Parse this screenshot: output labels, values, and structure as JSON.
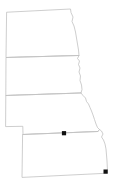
{
  "figure": {
    "title": "Great Plains states outline map",
    "width": 119,
    "height": 192,
    "background_color": "#ffffff",
    "border_color": "#b9b9b9",
    "internal_border_color": "#c2c2c2",
    "marker_color": "#111111"
  },
  "regions": [
    {
      "id": "north-dakota",
      "label": "North Dakota",
      "outline": "M 7.0,12.2 L 70.5,9.0 L 71.0,12.5 L 73.0,17.0 L 72.0,21.5 L 74.0,26.0 L 75.5,32.0 L 76.5,38.0 L 77.5,44.0 L 78.5,50.0 L 79.0,55.5 L 6.4,57.5 Z"
    },
    {
      "id": "south-dakota",
      "label": "South Dakota",
      "outline": "M 6.4,57.5 L 79.0,55.5 L 77.5,58.5 L 79.5,61.0 L 78.5,64.5 L 80.0,68.0 L 79.0,72.0 L 80.5,76.0 L 80.0,80.5 L 81.5,85.0 L 82.0,89.5 L 81.0,93.0 L 6.2,95.5 Z"
    },
    {
      "id": "nebraska",
      "label": "Nebraska",
      "outline": "M 6.2,95.5 L 81.0,93.0 L 83.0,95.5 L 85.5,98.0 L 86.5,101.5 L 88.5,104.0 L 90.0,107.5 L 91.5,111.0 L 93.0,115.0 L 94.5,119.5 L 96.0,124.0 L 97.5,127.5 L 99.5,129.5 L 98.0,131.5 L 23.0,134.5 L 22.8,126.3 L 6.0,126.6 Z"
    },
    {
      "id": "kansas",
      "label": "Kansas",
      "outline": "M 23.0,134.5 L 98.0,131.5 L 99.5,129.5 L 101.5,131.0 L 103.0,134.0 L 101.5,137.0 L 103.5,140.0 L 105.0,144.0 L 106.0,149.0 L 106.5,155.0 L 107.0,161.0 L 107.3,167.0 L 107.6,173.2 L 22.4,177.4 Z"
    }
  ],
  "internal_borders": [
    {
      "id": "nd-sd-border",
      "label": "North Dakota / South Dakota boundary",
      "path": "M 6.4,57.5 L 79.0,55.5"
    },
    {
      "id": "sd-ne-border",
      "label": "South Dakota / Nebraska boundary",
      "path": "M 6.2,95.5 L 81.0,93.0"
    },
    {
      "id": "ne-ks-border",
      "label": "Nebraska / Kansas boundary",
      "path": "M 23.0,134.5 L 98.0,131.5"
    }
  ],
  "markers": [
    {
      "id": "marker-nebraska",
      "label": "Location marker in southern Nebraska",
      "x": 64.0,
      "y": 133.2,
      "size": 4.2
    },
    {
      "id": "marker-kansas",
      "label": "Location marker in southeast Kansas",
      "x": 105.6,
      "y": 171.6,
      "size": 4.2
    }
  ]
}
